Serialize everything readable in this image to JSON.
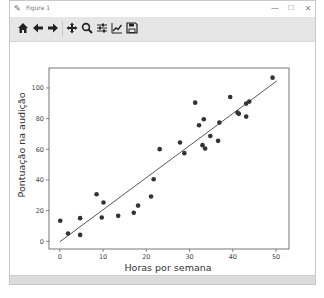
{
  "window": {
    "title": "Figure 1",
    "controls": {
      "minimize": "—",
      "maximize": "☐",
      "close": "✕"
    }
  },
  "toolbar": {
    "buttons": [
      {
        "name": "home",
        "icon": "home-icon"
      },
      {
        "name": "back",
        "icon": "arrow-left-icon"
      },
      {
        "name": "forward",
        "icon": "arrow-right-icon"
      },
      {
        "name": "pan",
        "icon": "move-icon"
      },
      {
        "name": "zoom",
        "icon": "magnifier-icon"
      },
      {
        "name": "configure-subplots",
        "icon": "sliders-icon"
      },
      {
        "name": "edit-axis",
        "icon": "line-chart-icon"
      },
      {
        "name": "save",
        "icon": "floppy-disk-icon"
      }
    ]
  },
  "chart_data": {
    "type": "scatter",
    "title": "",
    "xlabel": "Horas por semana",
    "ylabel": "Pontuação na audição",
    "xlim": [
      -2.5,
      53
    ],
    "ylim": [
      -5,
      113
    ],
    "xticks": [
      0,
      10,
      20,
      30,
      40,
      50
    ],
    "yticks": [
      0,
      20,
      40,
      60,
      80,
      100
    ],
    "grid": false,
    "legend": null,
    "colors": {
      "points": "#333333",
      "line": "#444444"
    },
    "series": [
      {
        "name": "observações",
        "type": "scatter",
        "points": [
          [
            0.1,
            13.4
          ],
          [
            1.9,
            5.1
          ],
          [
            4.7,
            15.1
          ],
          [
            4.7,
            4.2
          ],
          [
            8.5,
            30.7
          ],
          [
            10.1,
            25.3
          ],
          [
            9.7,
            15.5
          ],
          [
            13.5,
            16.6
          ],
          [
            17.1,
            18.6
          ],
          [
            18.1,
            23.3
          ],
          [
            21.1,
            29.2
          ],
          [
            21.7,
            40.5
          ],
          [
            23.1,
            60.1
          ],
          [
            27.8,
            64.4
          ],
          [
            28.8,
            57.5
          ],
          [
            31.3,
            90.4
          ],
          [
            32.2,
            75.7
          ],
          [
            33.3,
            79.6
          ],
          [
            33.0,
            62.7
          ],
          [
            33.6,
            60.5
          ],
          [
            34.8,
            68.7
          ],
          [
            36.6,
            65.5
          ],
          [
            36.9,
            77.4
          ],
          [
            39.4,
            94.1
          ],
          [
            41.1,
            83.9
          ],
          [
            41.4,
            83.1
          ],
          [
            43.1,
            89.8
          ],
          [
            43.8,
            91.1
          ],
          [
            43.1,
            81.3
          ],
          [
            49.2,
            106.7
          ]
        ]
      },
      {
        "name": "regressão linear",
        "type": "line",
        "points": [
          [
            0,
            -0.3
          ],
          [
            50.2,
            104.6
          ]
        ]
      }
    ]
  }
}
